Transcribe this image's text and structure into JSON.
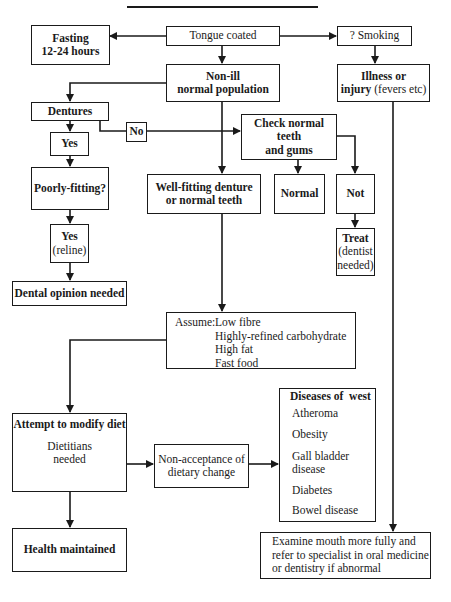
{
  "diagram": {
    "title": "",
    "nodes": {
      "tongue_coated": "Tongue coated",
      "fasting": {
        "line1": "Fasting",
        "line2": "12-24 hours"
      },
      "smoking": "? Smoking",
      "non_ill": {
        "line1": "Non-ill",
        "line2": "normal population"
      },
      "illness": {
        "line1_bold": "Illness or",
        "line2_bold": "injury",
        "line2_normal": " (fevers etc)"
      },
      "dentures": "Dentures",
      "no": "No",
      "check_teeth": {
        "line1": "Check normal teeth",
        "line2": "and gums"
      },
      "yes1": "Yes",
      "poorly_fitting": "Poorly-fitting?",
      "well_fitting": {
        "line1": "Well-fitting denture",
        "line2": "or normal teeth"
      },
      "normal": "Normal",
      "not": "Not",
      "yes_reline": {
        "line1": "Yes",
        "line2": "(reline)"
      },
      "treat": {
        "line1": "Treat",
        "line2": "(dentist",
        "line3": "needed)"
      },
      "dental_opinion": "Dental opinion needed",
      "assume": {
        "label": "Assume:",
        "items": [
          "Low fibre",
          "Highly-refined carbohydrate",
          "High fat",
          "Fast food"
        ]
      },
      "diseases_of_west": {
        "heading": "Diseases of  west",
        "items": [
          "Atheroma",
          "Obesity",
          "Gall bladder",
          "disease",
          "Diabetes",
          "Bowel disease"
        ]
      },
      "attempt_modify": {
        "heading": "Attempt to modify diet",
        "line1": "Dietitians",
        "line2": "needed"
      },
      "non_acceptance": {
        "line1": "Non-acceptance of",
        "line2": "dietary change"
      },
      "health_maintained": "Health maintained",
      "examine": {
        "line1": "Examine mouth more fully and",
        "line2": "refer to specialist in oral medicine",
        "line3": "or dentistry if abnormal"
      }
    },
    "colors": {
      "ink": "#1a1a1a",
      "background": "#ffffff"
    }
  }
}
